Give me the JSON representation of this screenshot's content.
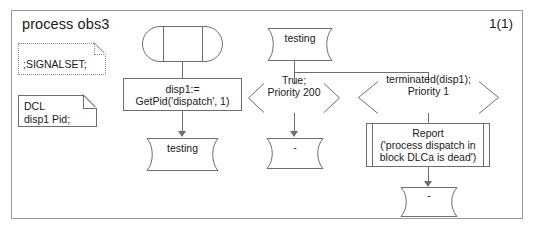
{
  "diagram": {
    "title": "process obs3",
    "page_number": "1(1)",
    "type": "SDL process diagram"
  },
  "declarations": {
    "signalset": {
      "label": ";SIGNALSET;",
      "symbol": "text-extension"
    },
    "dcl": {
      "label": "DCL\n  disp1 Pid;",
      "keyword": "DCL",
      "variable": "disp1 Pid;",
      "symbol": "text-symbol"
    }
  },
  "flow": {
    "start": {
      "symbol": "start",
      "label": ""
    },
    "task": {
      "symbol": "task",
      "label": "disp1:=\nGetPid('dispatch', 1)"
    },
    "state_testing_1": {
      "symbol": "state",
      "label": "testing"
    },
    "state_testing_2": {
      "symbol": "state",
      "label": "testing"
    },
    "input_true": {
      "symbol": "input",
      "label": "True;\nPriority 200"
    },
    "input_terminated": {
      "symbol": "input",
      "label": "terminated(disp1);\nPriority 1"
    },
    "state_dash_left": {
      "symbol": "state",
      "label": "-"
    },
    "procedure_report": {
      "symbol": "procedure-call",
      "label": "Report\n('process dispatch in\nblock DLCa is dead')"
    },
    "state_dash_right": {
      "symbol": "state",
      "label": "-"
    }
  },
  "colors": {
    "background": "#ffffff",
    "stroke": "#6e6e6e",
    "frame_stroke": "#9a9a9a",
    "text": "#1a1a1a",
    "dotted_stroke": "#8a8a8a"
  }
}
